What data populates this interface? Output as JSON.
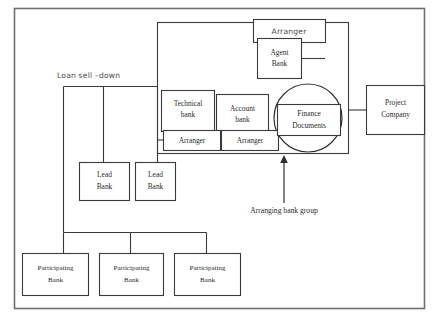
{
  "diagram": {
    "frame": {
      "name": "outer-frame"
    },
    "nodes": [
      {
        "id": "arranger_top",
        "label": "Arranger",
        "font": "hand",
        "x": 253,
        "y": 19,
        "w": 72,
        "h": 23
      },
      {
        "id": "agent_bank",
        "label": "Agent\nBank",
        "font": "serif",
        "x": 257,
        "y": 38,
        "w": 44,
        "h": 40
      },
      {
        "id": "technical_bank",
        "label": "Technical\nbank",
        "font": "serif",
        "x": 161,
        "y": 90,
        "w": 53,
        "h": 41
      },
      {
        "id": "account_bank",
        "label": "Account\nbank",
        "font": "serif",
        "x": 216,
        "y": 94,
        "w": 52,
        "h": 41
      },
      {
        "id": "arranger_technical",
        "label": "Arranger",
        "font": "serif",
        "x": 163,
        "y": 130,
        "w": 57,
        "h": 20
      },
      {
        "id": "arranger_account",
        "label": "Arranger",
        "font": "serif",
        "x": 221,
        "y": 130,
        "w": 57,
        "h": 20
      },
      {
        "id": "finance_documents",
        "label": "Finance\nDocuments",
        "font": "serif",
        "x": 277,
        "y": 104,
        "w": 63,
        "h": 31
      },
      {
        "id": "project_company",
        "label": "Project\nCompany",
        "font": "serif",
        "x": 366,
        "y": 85,
        "w": 58,
        "h": 49
      },
      {
        "id": "lead_bank_1",
        "label": "Lead\nBank",
        "font": "serif",
        "x": 79,
        "y": 162,
        "w": 50,
        "h": 38
      },
      {
        "id": "lead_bank_2",
        "label": "Lead\nBank",
        "font": "serif",
        "x": 135,
        "y": 162,
        "w": 40,
        "h": 38
      },
      {
        "id": "participating_bank_1",
        "label": "Participating\nBank",
        "font": "serif",
        "x": 22,
        "y": 253,
        "w": 66,
        "h": 42
      },
      {
        "id": "participating_bank_2",
        "label": "Participating\nBank",
        "font": "serif",
        "x": 99,
        "y": 253,
        "w": 64,
        "h": 42
      },
      {
        "id": "participating_bank_3",
        "label": "Participating\nBank",
        "font": "serif",
        "x": 174,
        "y": 253,
        "w": 66,
        "h": 42
      }
    ],
    "groups": [
      {
        "id": "agent_group",
        "x": 157,
        "y": 22,
        "w": 191,
        "h": 131
      }
    ],
    "ellipses": [
      {
        "id": "finance_documents_circle",
        "cx": 308,
        "cy": 118,
        "rx": 34,
        "ry": 34
      }
    ],
    "annotations": [
      {
        "id": "loan_sell_down",
        "label": "Loan sell –down",
        "x": 57,
        "y": 76,
        "font": "hand"
      },
      {
        "id": "arranging_bank_group",
        "label": "Arranging bank group",
        "x": 284,
        "y": 211,
        "font": "serif"
      }
    ],
    "arrow": {
      "id": "arranging-bank-group-arrow",
      "from_x": 284,
      "from_y": 203,
      "to_x": 284,
      "to_y": 157
    },
    "colors": {
      "stroke": "#3a3a3a",
      "frame": "#6e6e6e",
      "text": "#2b2b2b",
      "hand_text": "#4a4a4a",
      "background": "#ffffff"
    }
  }
}
